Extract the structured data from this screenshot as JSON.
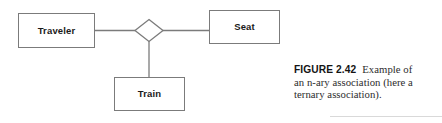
{
  "figure": {
    "label": "FIGURE 2.42",
    "caption_lines": [
      "Example of",
      "an n-ary association (here a",
      "ternary association)."
    ],
    "caption_full": "FIGURE 2.42 Example of an n-ary association (here a ternary association)."
  },
  "diagram": {
    "type": "uml-class-diagram",
    "association_kind": "n-ary (ternary) association",
    "association_symbol": "diamond",
    "classes": [
      {
        "name": "Traveler",
        "x": 18,
        "y": 13,
        "w": 77,
        "h": 35
      },
      {
        "name": "Seat",
        "x": 209,
        "y": 10,
        "w": 71,
        "h": 34
      },
      {
        "name": "Train",
        "x": 114,
        "y": 77,
        "w": 71,
        "h": 34
      }
    ],
    "diamond": {
      "cx": 149,
      "cy": 30,
      "rx": 14,
      "ry": 11
    },
    "connectors": [
      {
        "from": "Traveler",
        "to": "diamond"
      },
      {
        "from": "diamond",
        "to": "Seat"
      },
      {
        "from": "diamond",
        "to": "Train"
      }
    ]
  },
  "colors": {
    "stroke": "#7b7b7b",
    "text": "#1a1a1a",
    "caption_text": "#2c2c2c",
    "caption_label": "#141414",
    "rule": "#d9d9d9",
    "background": "#ffffff"
  }
}
